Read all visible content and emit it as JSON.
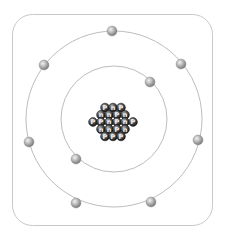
{
  "diagram": {
    "type": "bohr-atom-model",
    "frame": {
      "x": 12,
      "y": 14,
      "width": 200,
      "height": 211,
      "radius": 20,
      "stroke": "#c8c8c8"
    },
    "center": {
      "x": 114,
      "y": 119
    },
    "shells": [
      {
        "name": "inner-shell",
        "radius": 53,
        "stroke": "#bdbdbd",
        "electrons": [
          {
            "x": 150,
            "y": 82
          },
          {
            "x": 76,
            "y": 159
          }
        ]
      },
      {
        "name": "outer-shell",
        "radius": 88,
        "stroke": "#bdbdbd",
        "electrons": [
          {
            "x": 112,
            "y": 31
          },
          {
            "x": 181,
            "y": 64
          },
          {
            "x": 198,
            "y": 140
          },
          {
            "x": 151,
            "y": 202
          },
          {
            "x": 76,
            "y": 203
          },
          {
            "x": 29,
            "y": 142
          },
          {
            "x": 44,
            "y": 65
          }
        ]
      }
    ],
    "electron": {
      "radius": 5,
      "color_light": "#e6e6e6",
      "color_dark": "#8a8a8a"
    },
    "nucleus": {
      "particle_radius": 4.4,
      "spacing": 8,
      "rows": [
        [
          "P",
          "n",
          "P"
        ],
        [
          "n",
          "n",
          "P",
          "n"
        ],
        [
          "P",
          "P",
          "n",
          "P",
          "n",
          "P"
        ],
        [
          "n",
          "n",
          "P",
          "n"
        ],
        [
          "P",
          "P",
          "P"
        ]
      ],
      "proton_label": "P",
      "neutron_label": "n",
      "color_light": "#9a9a9a",
      "color_dark": "#1e1e1e"
    }
  }
}
